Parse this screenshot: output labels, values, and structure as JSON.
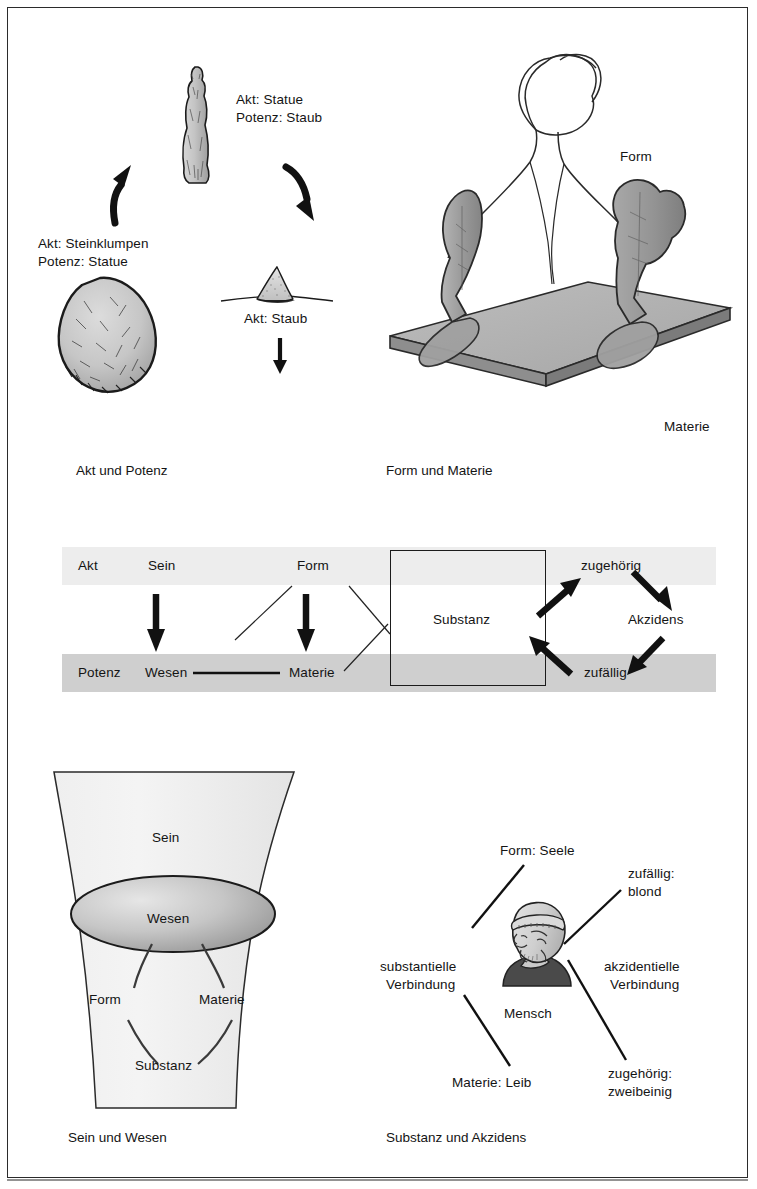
{
  "figure": {
    "language": "de",
    "panels": [
      {
        "id": "akt-potenz",
        "caption": "Akt und Potenz",
        "labels": [
          "Akt: Statue",
          "Potenz: Staub",
          "Akt: Steinklumpen",
          "Potenz: Statue",
          "Akt: Staub"
        ]
      },
      {
        "id": "form-materie",
        "caption": "Form und Materie",
        "labels": [
          "Form",
          "Materie"
        ]
      },
      {
        "id": "sein-wesen",
        "caption": "Sein und Wesen",
        "labels": [
          "Sein",
          "Wesen",
          "Form",
          "Materie",
          "Substanz"
        ]
      },
      {
        "id": "substanz-akzidens",
        "caption": "Substanz und Akzidens",
        "labels": [
          "Form: Seele",
          "zufällig:\nblond",
          "substantielle\nVerbindung",
          "akzidentielle\nVerbindung",
          "Mensch",
          "Materie: Leib",
          "zugehörig:\nzweibeinig"
        ]
      }
    ]
  },
  "panel_akt_potenz": {
    "caption": "Akt und Potenz",
    "statue_label_line1": "Akt: Statue",
    "statue_label_line2": "Potenz: Staub",
    "stone_label_line1": "Akt: Steinklumpen",
    "stone_label_line2": "Potenz: Statue",
    "dust_label": "Akt: Staub"
  },
  "panel_form_materie": {
    "caption": "Form und Materie",
    "form_label": "Form",
    "materie_label": "Materie"
  },
  "panel_middle": {
    "row_top": [
      "Akt",
      "Sein",
      "Form"
    ],
    "row_bottom": [
      "Potenz",
      "Wesen",
      "Materie"
    ],
    "akt": "Akt",
    "sein": "Sein",
    "form": "Form",
    "potenz": "Potenz",
    "wesen": "Wesen",
    "materie": "Materie",
    "substanz": "Substanz",
    "zugehoerig": "zugehörig",
    "akzidens": "Akzidens",
    "zufaellig": "zufällig",
    "band_top_color": "#ededed",
    "band_bottom_color": "#cfcfcf"
  },
  "panel_sein_wesen": {
    "caption": "Sein und Wesen",
    "sein": "Sein",
    "wesen": "Wesen",
    "form": "Form",
    "materie": "Materie",
    "substanz": "Substanz"
  },
  "panel_substanz_akzidens": {
    "caption": "Substanz und Akzidens",
    "form_seele": "Form: Seele",
    "zufaellig_line1": "zufällig:",
    "zufaellig_line2": "blond",
    "substantielle_line1": "substantielle",
    "substantielle_line2": "Verbindung",
    "akzidentielle_line1": "akzidentielle",
    "akzidentielle_line2": "Verbindung",
    "mensch": "Mensch",
    "materie_leib": "Materie: Leib",
    "zugehoerig_line1": "zugehörig:",
    "zugehoerig_line2": "zweibeinig"
  },
  "colors": {
    "ink": "#141414",
    "frame": "#2b2b2b",
    "band_light": "#ededed",
    "band_dark": "#cfcfcf",
    "stone_fill": "#c9c9c9",
    "plate_fill": "#b3b3b3",
    "plate_edge": "#7d7d7d",
    "shape_fill": "#9a9a9a"
  }
}
